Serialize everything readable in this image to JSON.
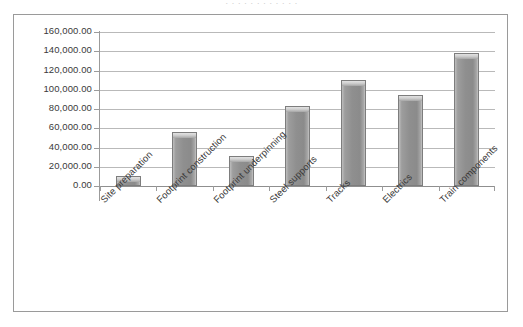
{
  "title_sliver": "· · · · · · · · · · · ·",
  "chart_data": {
    "type": "bar",
    "title": "",
    "xlabel": "",
    "ylabel": "",
    "categories": [
      "Site preparation",
      "Footprint construction",
      "Footprint underpinning",
      "Steel supports",
      "Tracks",
      "Electrics",
      "Train components"
    ],
    "values": [
      10000,
      56000,
      31000,
      83000,
      110000,
      95000,
      138000
    ],
    "ylim": [
      0,
      160000
    ],
    "ytick_values": [
      0,
      20000,
      40000,
      60000,
      80000,
      100000,
      120000,
      140000,
      160000
    ],
    "ytick_labels": [
      "0.00",
      "20,000.00",
      "40,000.00",
      "60,000.00",
      "80,000.00",
      "100,000.00",
      "120,000.00",
      "140,000.00",
      "160,000.00"
    ],
    "grid": true,
    "legend": false,
    "legend_position": "none",
    "series_color": "#8f8f8f",
    "gridline_color": "#b9b9b9",
    "axis_color": "#9b9b9b",
    "plot_background": "#ffffff",
    "frame_border_color": "#9a9a9a"
  }
}
